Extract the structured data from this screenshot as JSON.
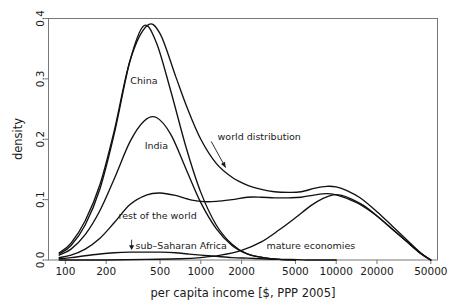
{
  "chart_data": {
    "type": "line",
    "title": "",
    "xlabel": "per capita income [$, PPP 2005]",
    "ylabel": "density",
    "xscale": "log",
    "xlim": [
      75,
      56000
    ],
    "ylim": [
      0.0,
      0.4
    ],
    "grid": false,
    "legend": "inline-annotations",
    "xticks": [
      100,
      200,
      500,
      1000,
      2000,
      5000,
      10000,
      20000,
      50000
    ],
    "xticklabels": [
      "100",
      "200",
      "500",
      "1000",
      "2000",
      "5000",
      "10000",
      "20000",
      "50000"
    ],
    "yticks": [
      0.0,
      0.1,
      0.2,
      0.3,
      0.4
    ],
    "yticklabels": [
      "0.0",
      "0.1",
      "0.2",
      "0.3",
      "0.4"
    ],
    "series": [
      {
        "name": "world distribution",
        "label": "world distribution",
        "x": [
          90,
          110,
          140,
          180,
          230,
          300,
          400,
          500,
          650,
          800,
          1000,
          1300,
          1700,
          2200,
          2800,
          3500,
          4500,
          5500,
          7000,
          8500,
          10000,
          12000,
          15000,
          20000,
          26000,
          33000,
          42000,
          50000
        ],
        "y": [
          0.012,
          0.028,
          0.065,
          0.125,
          0.215,
          0.33,
          0.388,
          0.375,
          0.305,
          0.25,
          0.2,
          0.16,
          0.137,
          0.124,
          0.117,
          0.113,
          0.112,
          0.113,
          0.119,
          0.122,
          0.121,
          0.115,
          0.103,
          0.08,
          0.056,
          0.034,
          0.012,
          0.0
        ]
      },
      {
        "name": "China",
        "label": "China",
        "x": [
          90,
          110,
          140,
          180,
          230,
          300,
          380,
          470,
          600,
          780,
          1000,
          1300,
          1700,
          2200,
          2900,
          3800,
          5000
        ],
        "y": [
          0.01,
          0.024,
          0.058,
          0.118,
          0.21,
          0.33,
          0.388,
          0.36,
          0.28,
          0.186,
          0.112,
          0.058,
          0.026,
          0.01,
          0.004,
          0.001,
          0.0
        ]
      },
      {
        "name": "India",
        "label": "India",
        "x": [
          90,
          110,
          140,
          180,
          230,
          300,
          380,
          470,
          600,
          780,
          1000,
          1300,
          1700,
          2200,
          2900,
          3800,
          5000
        ],
        "y": [
          0.008,
          0.018,
          0.042,
          0.082,
          0.135,
          0.196,
          0.23,
          0.236,
          0.208,
          0.15,
          0.095,
          0.052,
          0.024,
          0.01,
          0.004,
          0.001,
          0.0
        ]
      },
      {
        "name": "rest of the world",
        "label": "rest of the world",
        "x": [
          90,
          110,
          140,
          180,
          230,
          300,
          400,
          500,
          650,
          800,
          1000,
          1300,
          1700,
          2200,
          2800,
          3500,
          4500,
          5500,
          7000,
          8500,
          10000,
          12000,
          15000,
          20000,
          26000,
          33000,
          42000,
          50000
        ],
        "y": [
          0.004,
          0.008,
          0.018,
          0.036,
          0.062,
          0.092,
          0.108,
          0.111,
          0.107,
          0.101,
          0.097,
          0.097,
          0.1,
          0.104,
          0.104,
          0.103,
          0.103,
          0.104,
          0.108,
          0.11,
          0.108,
          0.102,
          0.092,
          0.073,
          0.051,
          0.031,
          0.011,
          0.0
        ]
      },
      {
        "name": "mature economies",
        "label": "mature economies",
        "x": [
          90,
          200,
          400,
          700,
          1000,
          1400,
          2000,
          2800,
          3800,
          5000,
          6500,
          8000,
          9500,
          11000,
          13000,
          16000,
          20000,
          26000,
          33000,
          42000,
          50000
        ],
        "y": [
          0.0,
          0.0,
          0.001,
          0.002,
          0.004,
          0.008,
          0.016,
          0.03,
          0.05,
          0.07,
          0.09,
          0.102,
          0.108,
          0.107,
          0.101,
          0.09,
          0.073,
          0.051,
          0.031,
          0.011,
          0.0
        ]
      },
      {
        "name": "sub-Saharan Africa",
        "label": "sub–Saharan Africa",
        "x": [
          90,
          110,
          140,
          180,
          230,
          300,
          400,
          500,
          650,
          800,
          1000,
          1300,
          1700,
          2200,
          2800,
          3600,
          4600,
          6000,
          8000,
          10000
        ],
        "y": [
          0.002,
          0.004,
          0.007,
          0.01,
          0.012,
          0.013,
          0.013,
          0.013,
          0.012,
          0.01,
          0.008,
          0.006,
          0.004,
          0.003,
          0.002,
          0.001,
          0.001,
          0.0,
          0.0,
          0.0
        ]
      }
    ],
    "annotations": [
      {
        "text": "China",
        "x": 380,
        "y": 0.295
      },
      {
        "text": "India",
        "x": 470,
        "y": 0.188
      },
      {
        "text": "world distribution",
        "x": 2700,
        "y": 0.203,
        "arrow_to_x": 1450,
        "arrow_to_y": 0.148
      },
      {
        "text": "rest of the world",
        "x": 480,
        "y": 0.072
      },
      {
        "text": "sub–Saharan Africa",
        "x": 330,
        "y": 0.022,
        "marker": "down-arrow"
      },
      {
        "text": "mature economies",
        "x": 6500,
        "y": 0.022
      }
    ]
  }
}
